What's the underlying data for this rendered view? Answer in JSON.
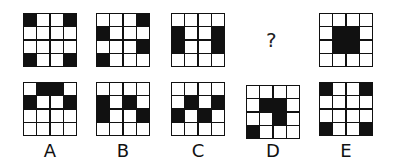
{
  "puzzle": {
    "question_row": [
      {
        "id": "q1",
        "cells": [
          [
            1,
            0,
            0,
            1
          ],
          [
            0,
            0,
            0,
            0
          ],
          [
            0,
            0,
            0,
            0
          ],
          [
            1,
            0,
            0,
            1
          ]
        ]
      },
      {
        "id": "q2",
        "cells": [
          [
            0,
            0,
            0,
            1
          ],
          [
            1,
            0,
            0,
            0
          ],
          [
            0,
            0,
            0,
            1
          ],
          [
            1,
            0,
            0,
            0
          ]
        ]
      },
      {
        "id": "q3",
        "cells": [
          [
            0,
            0,
            0,
            0
          ],
          [
            1,
            0,
            0,
            1
          ],
          [
            1,
            0,
            0,
            1
          ],
          [
            0,
            0,
            0,
            0
          ]
        ]
      },
      {
        "id": "q4",
        "missing": true,
        "symbol": "?"
      },
      {
        "id": "q5",
        "cells": [
          [
            0,
            0,
            0,
            0
          ],
          [
            0,
            1,
            1,
            0
          ],
          [
            0,
            1,
            1,
            0
          ],
          [
            0,
            0,
            0,
            0
          ]
        ]
      }
    ],
    "options": [
      {
        "label": "A",
        "cells": [
          [
            0,
            1,
            1,
            0
          ],
          [
            1,
            0,
            0,
            1
          ],
          [
            0,
            0,
            0,
            0
          ],
          [
            0,
            0,
            0,
            0
          ]
        ]
      },
      {
        "label": "B",
        "cells": [
          [
            0,
            0,
            0,
            0
          ],
          [
            1,
            0,
            1,
            0
          ],
          [
            1,
            0,
            0,
            1
          ],
          [
            0,
            0,
            0,
            0
          ]
        ]
      },
      {
        "label": "C",
        "cells": [
          [
            0,
            0,
            0,
            0
          ],
          [
            0,
            1,
            0,
            1
          ],
          [
            1,
            0,
            1,
            0
          ],
          [
            0,
            0,
            0,
            0
          ]
        ]
      },
      {
        "label": "D",
        "cells": [
          [
            0,
            0,
            0,
            0
          ],
          [
            0,
            1,
            1,
            0
          ],
          [
            0,
            0,
            1,
            0
          ],
          [
            1,
            0,
            0,
            0
          ]
        ]
      },
      {
        "label": "E",
        "cells": [
          [
            1,
            0,
            0,
            1
          ],
          [
            0,
            0,
            0,
            0
          ],
          [
            0,
            0,
            0,
            0
          ],
          [
            1,
            0,
            0,
            1
          ]
        ]
      }
    ]
  },
  "colors": {
    "filled": "#111111",
    "empty": "#ffffff"
  }
}
